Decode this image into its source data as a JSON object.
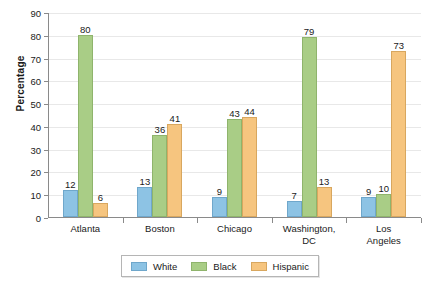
{
  "chart_data": {
    "type": "bar",
    "title": "",
    "xlabel": "",
    "ylabel": "Percentage",
    "ylim": [
      0,
      90
    ],
    "yticks": [
      0,
      10,
      20,
      30,
      40,
      50,
      60,
      70,
      80,
      90
    ],
    "grid": true,
    "legend_position": "bottom",
    "categories": [
      "Atlanta",
      "Boston",
      "Chicago",
      "Washington,\nDC",
      "Los Angeles"
    ],
    "series": [
      {
        "name": "White",
        "color": "#8dc3e4",
        "values": [
          12,
          13,
          9,
          7,
          9
        ]
      },
      {
        "name": "Black",
        "color": "#a9cd86",
        "values": [
          80,
          36,
          43,
          79,
          10
        ]
      },
      {
        "name": "Hispanic",
        "color": "#f6c57f",
        "values": [
          6,
          41,
          44,
          13,
          73
        ]
      }
    ]
  },
  "legend": {
    "items": [
      {
        "label": "White"
      },
      {
        "label": "Black"
      },
      {
        "label": "Hispanic"
      }
    ]
  },
  "colors": {
    "white_series": "#8dc3e4",
    "black_series": "#a9cd86",
    "hispanic_series": "#f6c57f",
    "axis": "#8a8a8a",
    "grid": "#e8e8e8",
    "text": "#1a1a1a",
    "background": "#ffffff"
  }
}
